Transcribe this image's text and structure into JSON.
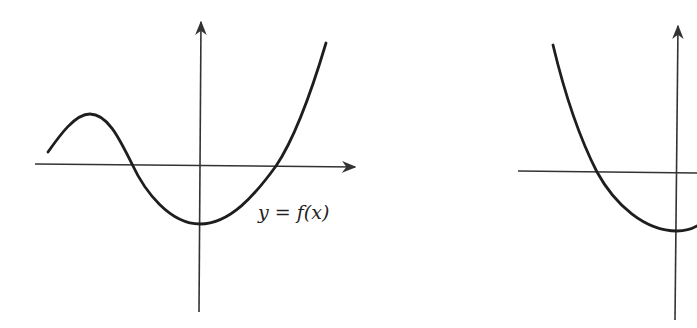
{
  "figure": {
    "colors": {
      "background": "#ffffff",
      "axis": "#333333",
      "curve": "#1e1e1e"
    },
    "left_graph": {
      "label": "y = f(x)",
      "curve_shape": "cubic-like: rises to local max on left, dips to min at y-axis, rises steeply on right",
      "x_intercepts_px": [
        132,
        276
      ],
      "local_max_px": [
        90,
        114
      ],
      "min_px": [
        200,
        224
      ]
    },
    "right_graph": {
      "label": "",
      "curve_shape": "parabola-like: descends from upper left, minimum at y-axis",
      "x_intercepts_px": [
        597
      ],
      "min_px": [
        677,
        231
      ]
    }
  }
}
